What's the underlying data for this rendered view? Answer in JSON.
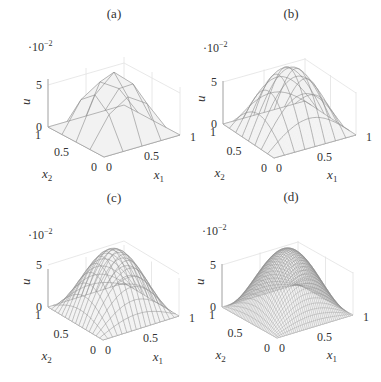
{
  "figure": {
    "panel_labels": [
      "(a)",
      "(b)",
      "(c)",
      "(d)"
    ]
  },
  "chart_data": [
    {
      "type": "surface3d",
      "panel": "(a)",
      "title": "(a)",
      "xlabel": "x1",
      "ylabel": "x2",
      "zlabel": "u",
      "z_multiplier": "·10^-2",
      "xticks": [
        "0",
        "0.5",
        "1"
      ],
      "yticks": [
        "0",
        "0.5",
        "1"
      ],
      "zticks": [
        "0",
        "5"
      ],
      "xlim": [
        0,
        1
      ],
      "ylim": [
        0,
        1
      ],
      "zlim": [
        0,
        0.075
      ],
      "mesh_lines": 4,
      "curved_lines": false,
      "peak_value": 0.07,
      "grid": true
    },
    {
      "type": "surface3d",
      "panel": "(b)",
      "title": "(b)",
      "xlabel": "x1",
      "ylabel": "x2",
      "zlabel": "u",
      "z_multiplier": "·10^-2",
      "xticks": [
        "0",
        "0.5",
        "1"
      ],
      "yticks": [
        "0",
        "0.5",
        "1"
      ],
      "zticks": [
        "0",
        "5"
      ],
      "xlim": [
        0,
        1
      ],
      "ylim": [
        0,
        1
      ],
      "zlim": [
        0,
        0.075
      ],
      "mesh_lines": 8,
      "curved_lines": true,
      "peak_value": 0.0737,
      "grid": true
    },
    {
      "type": "surface3d",
      "panel": "(c)",
      "title": "(c)",
      "xlabel": "x1",
      "ylabel": "x2",
      "zlabel": "u",
      "z_multiplier": "·10^-2",
      "xticks": [
        "0",
        "0.5",
        "1"
      ],
      "yticks": [
        "0",
        "0.5",
        "1"
      ],
      "zticks": [
        "0",
        "5"
      ],
      "xlim": [
        0,
        1
      ],
      "ylim": [
        0,
        1
      ],
      "zlim": [
        0,
        0.075
      ],
      "mesh_lines": 16,
      "curved_lines": true,
      "peak_value": 0.0737,
      "grid": true
    },
    {
      "type": "surface3d",
      "panel": "(d)",
      "title": "(d)",
      "xlabel": "x1",
      "ylabel": "x2",
      "zlabel": "u",
      "z_multiplier": "·10^-2",
      "xticks": [
        "0",
        "0.5",
        "1"
      ],
      "yticks": [
        "0",
        "0.5",
        "1"
      ],
      "zticks": [
        "0",
        "5"
      ],
      "xlim": [
        0,
        1
      ],
      "ylim": [
        0,
        1
      ],
      "zlim": [
        0,
        0.075
      ],
      "mesh_lines": 40,
      "curved_lines": true,
      "peak_value": 0.0737,
      "grid": true
    }
  ],
  "style": {
    "surface_fill": "#f2f2f2",
    "mesh_color": "#8a8a8a",
    "box_color": "#e2e2e2",
    "axis_color": "#999999",
    "text_color": "#333333"
  }
}
